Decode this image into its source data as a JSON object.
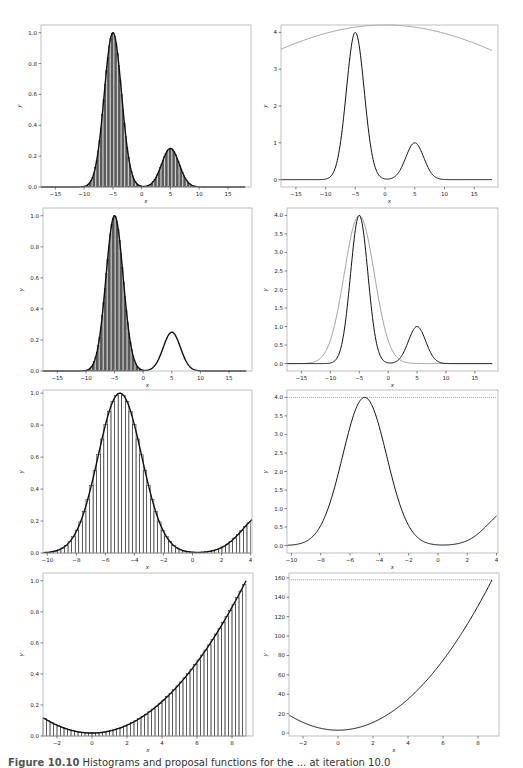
{
  "figure": {
    "caption_label": "Figure 10.10",
    "caption_text": "Histograms and proposal functions for the ... at iteration 10.0"
  },
  "colors": {
    "curve": "#111111",
    "bars": "#222222",
    "proposal": "#9a9a9a",
    "frame": "#b0b0b0"
  },
  "chart_data": [
    {
      "id": "r1-left",
      "type": "bar",
      "title": "",
      "xlabel": "x",
      "ylabel": "y",
      "xlim": [
        -17.5,
        19
      ],
      "ylim": [
        0,
        1.05
      ],
      "xticks": [
        -15,
        -10,
        -5,
        0,
        5,
        10,
        15
      ],
      "yticks": [
        0.0,
        0.2,
        0.4,
        0.6,
        0.8,
        1.0
      ],
      "ytick_fmt": 1,
      "target": {
        "peaks": [
          {
            "mu": -5,
            "sigma": 1.5,
            "amp": 1.0
          },
          {
            "mu": 5,
            "sigma": 1.5,
            "amp": 0.25
          }
        ]
      },
      "histogram": {
        "range": [
          -12,
          12
        ],
        "bins": 100,
        "follows": "target"
      },
      "proposal": null,
      "frame": {
        "x": 41,
        "y": 25,
        "w": 210,
        "h": 162
      }
    },
    {
      "id": "r1-right",
      "type": "line",
      "title": "",
      "xlabel": "x",
      "ylabel": "y",
      "xlim": [
        -17.5,
        19
      ],
      "ylim": [
        -0.2,
        4.2
      ],
      "xticks": [
        -15,
        -10,
        -5,
        0,
        5,
        10,
        15
      ],
      "yticks": [
        0,
        1,
        2,
        3,
        4
      ],
      "ytick_fmt": 0,
      "target": {
        "scale": 4,
        "peaks": [
          {
            "mu": -5,
            "sigma": 1.5,
            "amp": 1.0
          },
          {
            "mu": 5,
            "sigma": 1.5,
            "amp": 0.25
          }
        ]
      },
      "histogram": null,
      "proposal": {
        "kind": "gauss",
        "mu": 0,
        "sigma": 30,
        "amp": 4.2,
        "x_range": [
          -17.5,
          18
        ]
      },
      "frame": {
        "x": 281,
        "y": 25,
        "w": 217,
        "h": 162
      }
    },
    {
      "id": "r2-left",
      "type": "bar",
      "title": "",
      "xlabel": "x",
      "ylabel": "y",
      "xlim": [
        -17.5,
        19
      ],
      "ylim": [
        0,
        1.05
      ],
      "xticks": [
        -15,
        -10,
        -5,
        0,
        5,
        10,
        15
      ],
      "yticks": [
        0.0,
        0.2,
        0.4,
        0.6,
        0.8,
        1.0
      ],
      "ytick_fmt": 1,
      "target": {
        "peaks": [
          {
            "mu": -5,
            "sigma": 1.5,
            "amp": 1.0
          },
          {
            "mu": 5,
            "sigma": 1.5,
            "amp": 0.25
          }
        ]
      },
      "histogram": {
        "range": [
          -11,
          3
        ],
        "bins": 60,
        "follows": "first-peak"
      },
      "proposal": null,
      "frame": {
        "x": 43,
        "y": 208,
        "w": 209,
        "h": 163
      }
    },
    {
      "id": "r2-right",
      "type": "line",
      "title": "",
      "xlabel": "x",
      "ylabel": "y",
      "xlim": [
        -17.5,
        19
      ],
      "ylim": [
        -0.2,
        4.2
      ],
      "xticks": [
        -15,
        -10,
        -5,
        0,
        5,
        10,
        15
      ],
      "yticks": [
        0.0,
        0.5,
        1.0,
        1.5,
        2.0,
        2.5,
        3.0,
        3.5,
        4.0
      ],
      "ytick_fmt": 1,
      "target": {
        "scale": 4,
        "peaks": [
          {
            "mu": -5,
            "sigma": 1.5,
            "amp": 1.0
          },
          {
            "mu": 5,
            "sigma": 1.5,
            "amp": 0.25
          }
        ]
      },
      "histogram": null,
      "proposal": {
        "kind": "gauss",
        "mu": -5,
        "sigma": 2.6,
        "amp": 4.0,
        "x_range": [
          -17.5,
          18
        ]
      },
      "frame": {
        "x": 287,
        "y": 208,
        "w": 211,
        "h": 163
      }
    },
    {
      "id": "r3-left",
      "type": "bar",
      "title": "",
      "xlabel": "x",
      "ylabel": "y",
      "xlim": [
        -10.3,
        4.1
      ],
      "ylim": [
        0,
        1.02
      ],
      "xticks": [
        -10,
        -8,
        -6,
        -4,
        -2,
        0,
        2,
        4
      ],
      "yticks": [
        0.0,
        0.2,
        0.4,
        0.6,
        0.8,
        1.0
      ],
      "ytick_fmt": 1,
      "target": {
        "peaks": [
          {
            "mu": -5,
            "sigma": 1.5,
            "amp": 1.0
          },
          {
            "mu": 5,
            "sigma": 1.5,
            "amp": 0.25
          }
        ]
      },
      "histogram": {
        "range": [
          -10.3,
          4
        ],
        "bins": 58,
        "follows": "target"
      },
      "proposal": null,
      "frame": {
        "x": 43,
        "y": 390,
        "w": 209,
        "h": 163
      }
    },
    {
      "id": "r3-right",
      "type": "line",
      "title": "",
      "xlabel": "x",
      "ylabel": "y",
      "xlim": [
        -10.3,
        4.1
      ],
      "ylim": [
        -0.2,
        4.2
      ],
      "xticks": [
        -10,
        -8,
        -6,
        -4,
        -2,
        0,
        2,
        4
      ],
      "yticks": [
        0.0,
        0.5,
        1.0,
        1.5,
        2.0,
        2.5,
        3.0,
        3.5,
        4.0
      ],
      "ytick_fmt": 1,
      "target": {
        "scale": 4,
        "peaks": [
          {
            "mu": -5,
            "sigma": 1.5,
            "amp": 1.0
          },
          {
            "mu": 5,
            "sigma": 1.5,
            "amp": 0.25
          }
        ]
      },
      "histogram": null,
      "proposal": {
        "kind": "const",
        "value": 4.0,
        "x_range": [
          -10.3,
          4
        ]
      },
      "frame": {
        "x": 287,
        "y": 390,
        "w": 211,
        "h": 163
      }
    },
    {
      "id": "r4-left",
      "type": "bar",
      "title": "",
      "xlabel": "x",
      "ylabel": "y",
      "xlim": [
        -2.8,
        9.2
      ],
      "ylim": [
        0,
        1.05
      ],
      "xticks": [
        -2,
        0,
        2,
        4,
        6,
        8
      ],
      "yticks": [
        0.0,
        0.2,
        0.4,
        0.6,
        0.8,
        1.0
      ],
      "ytick_fmt": 1,
      "target": {
        "kind": "quad",
        "a": 2,
        "c": 3,
        "norm": 158
      },
      "histogram": {
        "range": [
          -2.8,
          8.8
        ],
        "bins": 58,
        "follows": "target"
      },
      "proposal": null,
      "frame": {
        "x": 43,
        "y": 573,
        "w": 210,
        "h": 163
      }
    },
    {
      "id": "r4-right",
      "type": "line",
      "title": "",
      "xlabel": "x",
      "ylabel": "y",
      "xlim": [
        -2.8,
        9.2
      ],
      "ylim": [
        -3,
        165
      ],
      "xticks": [
        -2,
        0,
        2,
        4,
        6,
        8
      ],
      "yticks": [
        0,
        20,
        40,
        60,
        80,
        100,
        120,
        140,
        160
      ],
      "ytick_fmt": 0,
      "target": {
        "kind": "quad",
        "a": 2,
        "c": 3,
        "norm": 1
      },
      "histogram": null,
      "proposal": {
        "kind": "const",
        "value": 158,
        "x_range": [
          -2.8,
          8.8
        ]
      },
      "frame": {
        "x": 289,
        "y": 573,
        "w": 210,
        "h": 163
      }
    }
  ]
}
